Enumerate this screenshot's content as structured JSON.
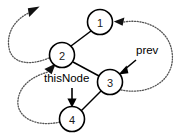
{
  "diagram": {
    "background_color": "#ffffff",
    "node_stroke_color": "#000000",
    "solid_edge_color": "#000000",
    "dotted_edge_color": "#555555",
    "nodes": [
      {
        "id": "node-1",
        "label": "1",
        "cx": 100,
        "cy": 22,
        "r": 12.5
      },
      {
        "id": "node-2",
        "label": "2",
        "cx": 62,
        "cy": 55,
        "r": 12.5
      },
      {
        "id": "node-3",
        "label": "3",
        "cx": 110,
        "cy": 82,
        "r": 12.5
      },
      {
        "id": "node-4",
        "label": "4",
        "cx": 72,
        "cy": 119,
        "r": 12.5
      }
    ],
    "solid_edges": [
      {
        "id": "edge-2-1",
        "from": "node-2",
        "to": "node-1"
      },
      {
        "id": "edge-2-3",
        "from": "node-2",
        "to": "node-3"
      },
      {
        "id": "edge-3-4",
        "from": "node-3",
        "to": "node-4"
      }
    ],
    "dotted_edges": [
      {
        "id": "dotted-3-to-1",
        "from": "node-3",
        "to": "node-1",
        "style": "dotted",
        "arrow": "end"
      },
      {
        "id": "dotted-4-to-2",
        "from": "node-4",
        "to": "node-2",
        "style": "dotted",
        "arrow": "end"
      },
      {
        "id": "dotted-2-to-outside",
        "from": "node-2",
        "to": "top-left",
        "style": "dotted",
        "arrow": "end"
      }
    ],
    "pointers": [
      {
        "id": "pointer-prev",
        "label": "prev",
        "target": "node-3",
        "label_x": 136,
        "label_y": 54
      },
      {
        "id": "pointer-thisnode",
        "label": "thisNode",
        "target": "node-4",
        "label_x": 44,
        "label_y": 82
      }
    ]
  }
}
